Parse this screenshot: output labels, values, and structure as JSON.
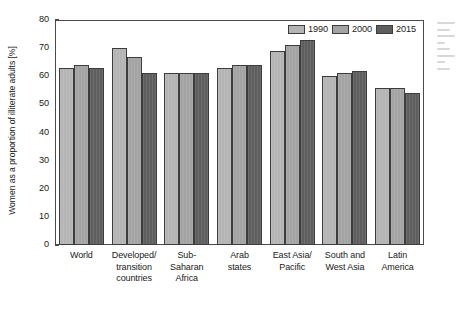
{
  "chart_data": {
    "type": "bar",
    "title": "",
    "xlabel": "",
    "ylabel": "Women as a proportion of illiterate adults [%]",
    "ylim": [
      0,
      80
    ],
    "ytick_step": 10,
    "yticks": [
      "80",
      "70",
      "60",
      "50",
      "40",
      "30",
      "20",
      "10",
      "0"
    ],
    "grid": false,
    "legend_position": "top-right",
    "categories": [
      "World",
      "Developed/\ntransition\ncountries",
      "Sub-\nSaharan\nAfrica",
      "Arab\nstates",
      "East Asia/\nPacific",
      "South and\nWest Asia",
      "Latin\nAmerica"
    ],
    "category_lines": [
      [
        "World"
      ],
      [
        "Developed/",
        "transition",
        "countries"
      ],
      [
        "Sub-",
        "Saharan",
        "Africa"
      ],
      [
        "Arab",
        "states"
      ],
      [
        "East Asia/",
        "Pacific"
      ],
      [
        "South and",
        "West Asia"
      ],
      [
        "Latin",
        "America"
      ]
    ],
    "series": [
      {
        "name": "1990",
        "color": "#b4b4b4",
        "values": [
          63,
          70,
          61,
          63,
          69,
          60,
          56
        ]
      },
      {
        "name": "2000",
        "color": "#a3a3a3",
        "values": [
          64,
          67,
          61,
          64,
          71,
          61,
          56
        ]
      },
      {
        "name": "2015",
        "color": "#5e5e5e",
        "values": [
          63,
          61,
          61,
          64,
          73,
          62,
          54
        ]
      }
    ]
  },
  "legend": {
    "items": [
      {
        "label": "1990"
      },
      {
        "label": "2000"
      },
      {
        "label": "2015"
      }
    ]
  },
  "colors": {
    "series_1990": "#b4b4b4",
    "series_2000": "#a3a3a3",
    "series_2015": "#5e5e5e",
    "frame": "#4a4a4a",
    "text": "#1a1a1a",
    "background": "#ffffff"
  }
}
